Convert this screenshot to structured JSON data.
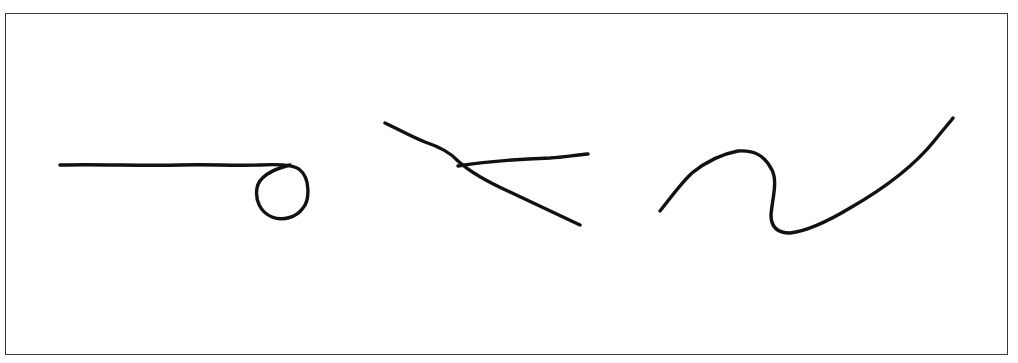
{
  "figure": {
    "frame": {
      "border_color": "#3a3a3a",
      "background": "#ffffff"
    },
    "stroke_color": "#111111",
    "strokes": [
      {
        "id": "stroke-line-with-loop",
        "shape": "horizontal line ending in a loop",
        "d": "M60,165 C100,164 140,166 180,165 C210,164 230,166 260,165 C280,164 295,165 300,170 C310,178 310,200 303,208 C296,218 282,221 272,217 C260,212 255,200 257,188 C259,177 270,170 290,165"
      },
      {
        "id": "stroke-crossing-lines-a",
        "shape": "descending diagonal line",
        "d": "M385,123 C400,130 410,136 425,142 C440,147 450,152 458,161 C470,172 490,183 510,192 C535,204 555,213 580,225"
      },
      {
        "id": "stroke-crossing-lines-b",
        "shape": "near-horizontal line crossing the diagonal",
        "d": "M458,166 C490,161 520,159 550,158 C565,157 575,155 588,154"
      },
      {
        "id": "stroke-s-curve",
        "shape": "S-shaped wave",
        "d": "M660,211 C672,196 682,182 692,173 C708,160 722,154 738,151 C755,150 765,156 772,170 C778,182 772,200 771,215 C771,228 778,233 790,233 C808,231 830,220 850,208 C885,188 915,165 935,140 C943,130 950,122 953,118"
      }
    ]
  }
}
